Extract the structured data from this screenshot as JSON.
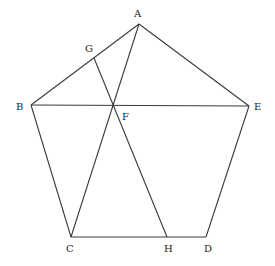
{
  "diagram": {
    "type": "geometric-figure",
    "points": {
      "A": {
        "x": 139,
        "y": 24,
        "label": "A",
        "lx": 134,
        "ly": 17
      },
      "B": {
        "x": 31,
        "y": 105,
        "label": "B",
        "lx": 16,
        "ly": 110
      },
      "C": {
        "x": 71,
        "y": 237,
        "label": "C",
        "lx": 66,
        "ly": 252
      },
      "D": {
        "x": 206,
        "y": 237,
        "label": "D",
        "lx": 204,
        "ly": 252
      },
      "E": {
        "x": 249,
        "y": 106,
        "label": "E",
        "lx": 254,
        "ly": 110
      },
      "F": {
        "x": 113,
        "y": 105,
        "label": "F",
        "lx": 122,
        "ly": 120
      },
      "G": {
        "x": 94,
        "y": 58,
        "label": "G",
        "lx": 85,
        "ly": 52
      },
      "H": {
        "x": 167,
        "y": 237,
        "label": "H",
        "lx": 164,
        "ly": 252
      }
    },
    "segments": [
      [
        "A",
        "B"
      ],
      [
        "A",
        "E"
      ],
      [
        "B",
        "E"
      ],
      [
        "B",
        "C"
      ],
      [
        "C",
        "D"
      ],
      [
        "D",
        "E"
      ],
      [
        "A",
        "C"
      ],
      [
        "G",
        "H"
      ]
    ],
    "labels": [
      "A",
      "B",
      "C",
      "D",
      "E",
      "F",
      "G",
      "H"
    ]
  }
}
